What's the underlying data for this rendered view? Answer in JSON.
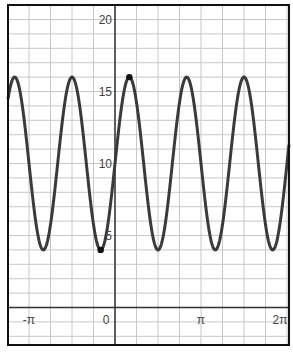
{
  "chart_data": {
    "type": "line",
    "title": "",
    "function": "y = 10 + 6 sin(3x)",
    "xlabel": "",
    "ylabel": "",
    "xlim": [
      -3.93,
      6.35
    ],
    "ylim": [
      -2.6,
      21
    ],
    "x_tick_labels": [
      "-π",
      "0",
      "π",
      "2π"
    ],
    "x_tick_values": [
      -3.14159,
      0,
      3.14159,
      6.28318
    ],
    "y_tick_labels": [
      "5",
      "10",
      "15",
      "20"
    ],
    "y_tick_values": [
      5,
      10,
      15,
      20
    ],
    "grid": true,
    "x_grid_step": "π/4",
    "y_grid_step": 1,
    "max": 16,
    "min": 4,
    "period": "2π/3",
    "highlighted_points": [
      {
        "x": -0.5236,
        "y": 4,
        "label": "minimum at -π/6"
      },
      {
        "x": 0.5236,
        "y": 16,
        "label": "maximum at π/6"
      }
    ]
  },
  "axes": {
    "x_labels": [
      "-π",
      "0",
      "π",
      "2π"
    ],
    "y_labels": [
      "5",
      "10",
      "15",
      "20"
    ]
  },
  "colors": {
    "curve": "#3a3a3a",
    "grid": "#c8c8c8",
    "axis": "#333333",
    "frame": "#111111"
  }
}
